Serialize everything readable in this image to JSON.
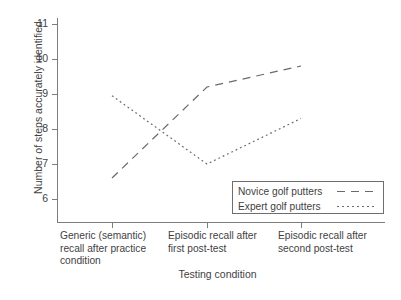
{
  "chart_data": {
    "type": "line",
    "title": "",
    "xlabel": "Testing condition",
    "ylabel": "Number of steps accurately identified",
    "categories": [
      "Generic (semantic)\nrecall after practice\ncondition",
      "Episodic recall after\nfirst post-test",
      "Episodic recall after\nsecond post-test"
    ],
    "yticks": [
      "6",
      "7",
      "8",
      "9",
      "10",
      "11"
    ],
    "ylim": [
      5.45,
      11.3
    ],
    "grid": false,
    "legend_position": "bottom-right",
    "series": [
      {
        "name": "Novice golf putters",
        "style": "dashed",
        "color": "#6a6a6a",
        "values": [
          6.6,
          9.2,
          9.8
        ]
      },
      {
        "name": "Expert golf putters",
        "style": "dotted",
        "color": "#6a6a6a",
        "values": [
          8.95,
          7.0,
          8.3
        ]
      }
    ]
  },
  "legend": {
    "novice_label": "Novice golf putters",
    "expert_label": "Expert golf putters"
  },
  "axes": {
    "y_title": "Number of steps accurately identified",
    "x_title": "Testing condition",
    "ytick_6": "6",
    "ytick_7": "7",
    "ytick_8": "8",
    "ytick_9": "9",
    "ytick_10": "10",
    "ytick_11": "11",
    "xtick_1": "Generic (semantic)\nrecall after practice\ncondition",
    "xtick_2": "Episodic recall after\nfirst post-test",
    "xtick_3": "Episodic recall after\nsecond post-test"
  }
}
